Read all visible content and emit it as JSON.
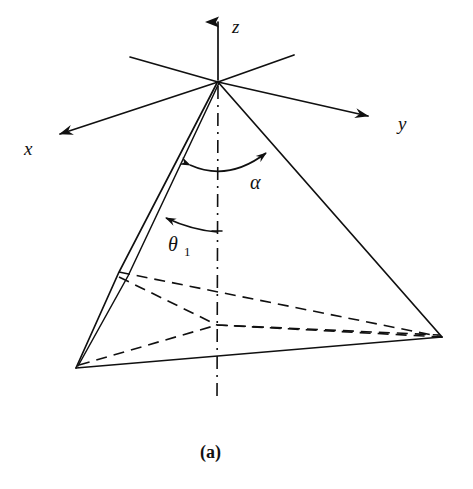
{
  "figure": {
    "caption": "(a)",
    "background_color": "#ffffff",
    "ink_color": "#101010"
  },
  "axes": {
    "z": {
      "label": "z",
      "label_x": 232,
      "label_y": 33
    },
    "x": {
      "label": "x",
      "label_x": 24,
      "label_y": 155
    },
    "y": {
      "label": "y",
      "label_x": 398,
      "label_y": 130
    }
  },
  "angles": {
    "alpha": {
      "label": "α",
      "label_x": 250,
      "label_y": 189
    },
    "theta": {
      "label": "θ",
      "subscript": "1",
      "label_x": 168,
      "label_y": 251,
      "sub_x": 184,
      "sub_y": 256
    }
  },
  "geometry": {
    "origin": {
      "x": 218,
      "y": 82
    },
    "base_center": {
      "x": 217,
      "y": 325
    },
    "vertex_left": {
      "x": 76,
      "y": 368
    },
    "vertex_right": {
      "x": 442,
      "y": 337
    },
    "z_arrow_tip": {
      "x": 218,
      "y": 17
    },
    "x_arrow_tip": {
      "x": 53,
      "y": 136
    },
    "y_arrow_tip": {
      "x": 374,
      "y": 118
    },
    "axis_neg_y_end": {
      "x": 130,
      "y": 57
    },
    "axis_neg_x_end": {
      "x": 294,
      "y": 55
    },
    "axis_below_end": {
      "x": 217,
      "y": 402
    },
    "sliver_break": {
      "x": 119,
      "y": 272
    }
  },
  "colors": {
    "ink": "#101010",
    "paper": "#ffffff"
  }
}
